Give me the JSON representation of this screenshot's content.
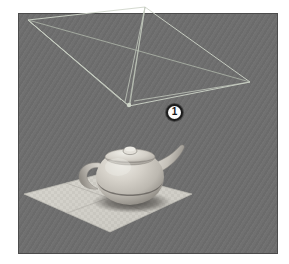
{
  "viewport": {
    "name": "3d-viewport",
    "background_color": "#6e6e6e",
    "border_color": "#4c4c4c",
    "rect": {
      "x": 18,
      "y": 13,
      "width": 260,
      "height": 241
    }
  },
  "annotation": {
    "badge_label": "1",
    "badge_center": {
      "x": 174,
      "y": 112
    },
    "badge_fill": "#fbfbfb",
    "badge_ring": "#1b1b1b"
  },
  "light_gizmo": {
    "name": "spotlight-wireframe",
    "line_color": "#cfd6c9",
    "line_color_dim": "#a7aea2",
    "apex": {
      "x": 147,
      "y": 119
    },
    "quad": [
      {
        "x": 46,
        "y": 33
      },
      {
        "x": 163,
        "y": 20
      },
      {
        "x": 268,
        "y": 95
      },
      {
        "x": 147,
        "y": 119
      }
    ],
    "diagonal_cross": {
      "x": 163,
      "y": 72
    },
    "cone_edges": [
      {
        "x": 46,
        "y": 33
      },
      {
        "x": 163,
        "y": 20
      },
      {
        "x": 268,
        "y": 95
      },
      {
        "x": 137,
        "y": 108
      },
      {
        "x": 155,
        "y": 105
      }
    ]
  },
  "teapot": {
    "name": "teapot-model",
    "body_color": "#c9c5bd",
    "highlight_color": "#e4e1da",
    "shade_color": "#8f8b84",
    "shadow_color": "#3d3b38",
    "center": {
      "x": 148,
      "y": 191
    },
    "body_radius_x": 33,
    "body_radius_y": 28
  },
  "floor": {
    "name": "checker-ground-plane",
    "fill_color": "#d2d0c9",
    "grid_color": "#b9b7b0",
    "corners": [
      {
        "x": 126,
        "y": 185
      },
      {
        "x": 210,
        "y": 207
      },
      {
        "x": 128,
        "y": 245
      },
      {
        "x": 42,
        "y": 207
      }
    ]
  }
}
